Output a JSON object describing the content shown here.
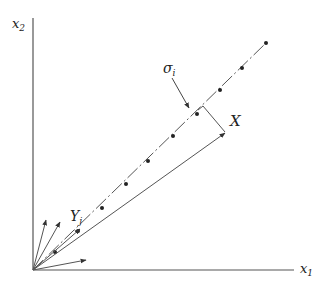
{
  "diagram": {
    "type": "vector-geometry",
    "axes": {
      "x_label": "x",
      "x_sub": "1",
      "y_label": "x",
      "y_sub": "2"
    },
    "labels": {
      "sigma": "σ",
      "sigma_sub": "i",
      "X": "X",
      "Y": "Y",
      "Y_sub": "j"
    },
    "colors": {
      "ink": "#333333",
      "background": "#ffffff"
    },
    "origin": [
      33,
      270
    ],
    "dashed_line": {
      "from": [
        33,
        270
      ],
      "to": [
        266,
        43
      ]
    },
    "dashed_line_points": [
      [
        55,
        252
      ],
      [
        78,
        231
      ],
      [
        102,
        208
      ],
      [
        126,
        184
      ],
      [
        148,
        161
      ],
      [
        173,
        136
      ],
      [
        197,
        114
      ],
      [
        220,
        90
      ],
      [
        242,
        68
      ],
      [
        266,
        43
      ]
    ],
    "solid_line_to_X": {
      "from": [
        33,
        270
      ],
      "to": [
        225,
        133
      ]
    },
    "bracket": {
      "from": [
        203,
        106
      ],
      "to": [
        225,
        132
      ]
    },
    "vectors_from_origin": [
      {
        "to": [
          46,
          218
        ]
      },
      {
        "to": [
          60,
          220
        ]
      },
      {
        "to": [
          77,
          228
        ]
      },
      {
        "to": [
          86,
          258
        ]
      }
    ]
  }
}
